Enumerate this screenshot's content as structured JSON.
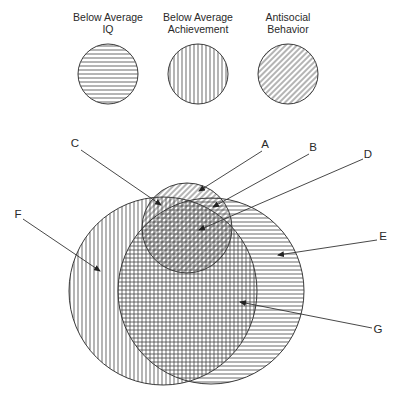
{
  "figure": {
    "width": 401,
    "height": 398,
    "background": "#ffffff",
    "stroke_color": "#3a3a3a",
    "hatch_color": "#444444",
    "hatch_spacing": 4
  },
  "legend": [
    {
      "id": "iq",
      "label_lines": [
        "Below Average",
        "IQ"
      ],
      "pattern": "horizontal",
      "cx": 108,
      "cy": 74,
      "r": 30,
      "label_x": 108,
      "label_y": [
        21,
        33
      ]
    },
    {
      "id": "achievement",
      "label_lines": [
        "Below Average",
        "Achievement"
      ],
      "pattern": "vertical",
      "cx": 198,
      "cy": 74,
      "r": 30,
      "label_x": 198,
      "label_y": [
        21,
        33
      ]
    },
    {
      "id": "antisocial",
      "label_lines": [
        "Antisocial",
        "Behavior"
      ],
      "pattern": "diagonal",
      "cx": 288,
      "cy": 74,
      "r": 30,
      "label_x": 288,
      "label_y": [
        21,
        33
      ]
    }
  ],
  "venn_sets": [
    {
      "id": "achievement",
      "name": "Below Average Achievement",
      "pattern": "vertical",
      "cx": 163,
      "cy": 291,
      "r": 94
    },
    {
      "id": "iq",
      "name": "Below Average IQ",
      "pattern": "horizontal",
      "cx": 211,
      "cy": 291,
      "r": 93
    },
    {
      "id": "antisocial",
      "name": "Antisocial Behavior",
      "pattern": "diagonal",
      "cx": 187,
      "cy": 228,
      "r": 45
    }
  ],
  "callouts": [
    {
      "label": "A",
      "label_x": 265,
      "label_y": 148,
      "line_from": [
        262,
        151
      ],
      "tip": [
        199,
        191
      ]
    },
    {
      "label": "B",
      "label_x": 313,
      "label_y": 151,
      "line_from": [
        309,
        154
      ],
      "tip": [
        213,
        207
      ]
    },
    {
      "label": "C",
      "label_x": 75,
      "label_y": 147,
      "line_from": [
        81,
        150
      ],
      "tip": [
        161,
        205
      ]
    },
    {
      "label": "D",
      "label_x": 368,
      "label_y": 158,
      "line_from": [
        363,
        159
      ],
      "tip": [
        199,
        230
      ]
    },
    {
      "label": "E",
      "label_x": 383,
      "label_y": 240,
      "line_from": [
        377,
        240
      ],
      "tip": [
        278,
        255
      ]
    },
    {
      "label": "F",
      "label_x": 18,
      "label_y": 218,
      "line_from": [
        23,
        219
      ],
      "tip": [
        100,
        271
      ]
    },
    {
      "label": "G",
      "label_x": 378,
      "label_y": 333,
      "line_from": [
        372,
        328
      ],
      "tip": [
        240,
        302
      ]
    }
  ]
}
